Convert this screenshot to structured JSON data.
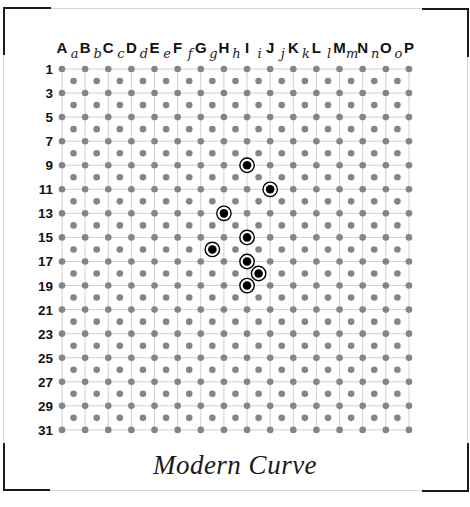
{
  "board": {
    "title": "Modern Curve",
    "columns": [
      "A",
      "B",
      "C",
      "D",
      "E",
      "F",
      "G",
      "H",
      "I",
      "J",
      "K",
      "L",
      "M",
      "N",
      "O",
      "P"
    ],
    "half_columns": [
      "a",
      "b",
      "c",
      "d",
      "e",
      "f",
      "g",
      "h",
      "i",
      "j",
      "k",
      "l",
      "m",
      "n",
      "o"
    ],
    "row_labels": [
      "1",
      "3",
      "5",
      "7",
      "9",
      "11",
      "13",
      "15",
      "17",
      "19",
      "21",
      "23",
      "25",
      "27",
      "29",
      "31"
    ],
    "rows_total": 31,
    "selected_points": [
      {
        "col": "I",
        "row": 9
      },
      {
        "col": "J",
        "row": 11
      },
      {
        "col": "H",
        "row": 13
      },
      {
        "col": "I",
        "row": 15
      },
      {
        "col": "g",
        "row": 16
      },
      {
        "col": "I",
        "row": 17
      },
      {
        "col": "i",
        "row": 18
      },
      {
        "col": "I",
        "row": 19
      }
    ],
    "colors": {
      "dot": "#858585",
      "grid_line": "#d0d0d0",
      "selected_fill": "#000000",
      "selected_ring": "#000000",
      "corner": "#1a1a1a",
      "frame": "#d8d8d8"
    }
  }
}
